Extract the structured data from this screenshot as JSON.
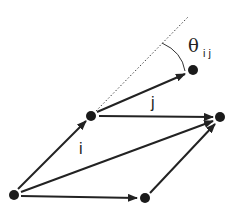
{
  "diagram": {
    "title": "",
    "nodes": [
      {
        "id": "a",
        "x": 14,
        "y": 195
      },
      {
        "id": "b",
        "x": 91,
        "y": 116
      },
      {
        "id": "c",
        "x": 193,
        "y": 70
      },
      {
        "id": "d",
        "x": 220,
        "y": 117
      },
      {
        "id": "e",
        "x": 145,
        "y": 198
      }
    ],
    "edges": [
      {
        "from": "a",
        "to": "b",
        "label": "i"
      },
      {
        "from": "b",
        "to": "d",
        "label": "j"
      },
      {
        "from": "b",
        "to": "c",
        "label": ""
      },
      {
        "from": "a",
        "to": "d",
        "label": ""
      },
      {
        "from": "a",
        "to": "e",
        "label": ""
      },
      {
        "from": "e",
        "to": "d",
        "label": ""
      }
    ],
    "labels": {
      "i": "i",
      "j": "j",
      "theta": "θ",
      "theta_sub": "ij"
    },
    "colors": {
      "stroke": "#222222",
      "node": "#1a1a1a"
    }
  }
}
